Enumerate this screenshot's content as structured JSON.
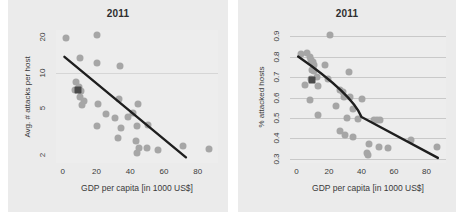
{
  "figure": {
    "background": "#ffffff",
    "panel_background": "#ebebeb",
    "marker_color": "#a6a6a6",
    "highlight_color": "#4a4a4a",
    "trend_color": "#1e1e1e"
  },
  "chart_data": [
    {
      "type": "scatter",
      "panel": "left",
      "title": "2011",
      "xlabel": "GDP per capita [in 1000 US$]",
      "ylabel": "Avg. # attacks per host",
      "xticks": [
        0,
        20,
        40,
        60,
        80
      ],
      "yticks": [
        2,
        5,
        10,
        20
      ],
      "xlim": [
        -4,
        92
      ],
      "ylim": [
        1.7,
        23
      ],
      "yscale": "log",
      "xscale": "linear",
      "grid": "horizontal-faint-at-10",
      "legend": "none",
      "points": [
        {
          "x": 2.0,
          "y": 19.6
        },
        {
          "x": 20.5,
          "y": 21.0
        },
        {
          "x": 10.5,
          "y": 13.2
        },
        {
          "x": 20.0,
          "y": 12.0
        },
        {
          "x": 34.0,
          "y": 11.3
        },
        {
          "x": 8.0,
          "y": 8.3
        },
        {
          "x": 9.5,
          "y": 7.6
        },
        {
          "x": 7.0,
          "y": 7.1
        },
        {
          "x": 11.0,
          "y": 7.0
        },
        {
          "x": 10.0,
          "y": 6.2
        },
        {
          "x": 12.5,
          "y": 5.7
        },
        {
          "x": 11.5,
          "y": 5.3
        },
        {
          "x": 21.0,
          "y": 5.4
        },
        {
          "x": 33.5,
          "y": 6.0
        },
        {
          "x": 44.5,
          "y": 5.4
        },
        {
          "x": 25.5,
          "y": 4.4
        },
        {
          "x": 31.0,
          "y": 4.1
        },
        {
          "x": 38.5,
          "y": 4.2
        },
        {
          "x": 41.5,
          "y": 4.5
        },
        {
          "x": 20.5,
          "y": 3.5
        },
        {
          "x": 34.5,
          "y": 3.4
        },
        {
          "x": 44.0,
          "y": 3.5
        },
        {
          "x": 50.5,
          "y": 3.6
        },
        {
          "x": 33.0,
          "y": 2.8
        },
        {
          "x": 43.5,
          "y": 2.6
        },
        {
          "x": 45.0,
          "y": 2.3
        },
        {
          "x": 50.0,
          "y": 2.3
        },
        {
          "x": 44.0,
          "y": 2.05
        },
        {
          "x": 56.5,
          "y": 2.2
        },
        {
          "x": 71.0,
          "y": 2.35
        },
        {
          "x": 86.5,
          "y": 2.25
        }
      ],
      "highlight_point": {
        "x": 9.0,
        "y": 7.1,
        "marker": "square"
      },
      "trend": {
        "shape": "straight-on-log-y",
        "x_start": 1.0,
        "y_start": 13.6,
        "x_end": 73.0,
        "y_end": 1.9
      }
    },
    {
      "type": "scatter",
      "panel": "right",
      "title": "2011",
      "xlabel": "GDP per capita [in 1000 US$]",
      "ylabel": "% attacked hosts",
      "xticks": [
        0,
        20,
        40,
        60,
        80
      ],
      "yticks": [
        0.3,
        0.4,
        0.5,
        0.6,
        0.7,
        0.8,
        0.9
      ],
      "xlim": [
        -4,
        92
      ],
      "ylim": [
        0.28,
        0.93
      ],
      "yscale": "linear",
      "xscale": "linear",
      "grid": "horizontal",
      "legend": "none",
      "points": [
        {
          "x": 20.5,
          "y": 0.905
        },
        {
          "x": 3.0,
          "y": 0.815
        },
        {
          "x": 6.5,
          "y": 0.82
        },
        {
          "x": 8.0,
          "y": 0.8
        },
        {
          "x": 9.0,
          "y": 0.785
        },
        {
          "x": 10.0,
          "y": 0.775
        },
        {
          "x": 10.5,
          "y": 0.76
        },
        {
          "x": 17.5,
          "y": 0.76
        },
        {
          "x": 9.5,
          "y": 0.735
        },
        {
          "x": 11.0,
          "y": 0.73
        },
        {
          "x": 32.0,
          "y": 0.725
        },
        {
          "x": 19.5,
          "y": 0.69
        },
        {
          "x": 9.0,
          "y": 0.69
        },
        {
          "x": 12.5,
          "y": 0.7
        },
        {
          "x": 5.0,
          "y": 0.66
        },
        {
          "x": 13.0,
          "y": 0.655
        },
        {
          "x": 26.5,
          "y": 0.635
        },
        {
          "x": 28.5,
          "y": 0.625
        },
        {
          "x": 29.0,
          "y": 0.605
        },
        {
          "x": 33.0,
          "y": 0.605
        },
        {
          "x": 40.5,
          "y": 0.595
        },
        {
          "x": 8.5,
          "y": 0.59
        },
        {
          "x": 24.5,
          "y": 0.56
        },
        {
          "x": 35.0,
          "y": 0.545
        },
        {
          "x": 13.5,
          "y": 0.515
        },
        {
          "x": 31.0,
          "y": 0.5
        },
        {
          "x": 38.0,
          "y": 0.495
        },
        {
          "x": 47.5,
          "y": 0.49
        },
        {
          "x": 49.5,
          "y": 0.49
        },
        {
          "x": 51.5,
          "y": 0.49
        },
        {
          "x": 27.0,
          "y": 0.435
        },
        {
          "x": 30.0,
          "y": 0.415
        },
        {
          "x": 34.5,
          "y": 0.405
        },
        {
          "x": 70.5,
          "y": 0.39
        },
        {
          "x": 44.5,
          "y": 0.375
        },
        {
          "x": 50.5,
          "y": 0.36
        },
        {
          "x": 56.5,
          "y": 0.355
        },
        {
          "x": 86.5,
          "y": 0.36
        },
        {
          "x": 43.5,
          "y": 0.33
        },
        {
          "x": 44.0,
          "y": 0.32
        }
      ],
      "highlight_point": {
        "x": 9.5,
        "y": 0.685,
        "marker": "square"
      },
      "trend": {
        "shape": "decaying-curve",
        "x_start": 1.0,
        "y_start": 0.8,
        "x_mid": 40.0,
        "y_mid": 0.505,
        "x_end": 87.0,
        "y_end": 0.305
      }
    }
  ]
}
